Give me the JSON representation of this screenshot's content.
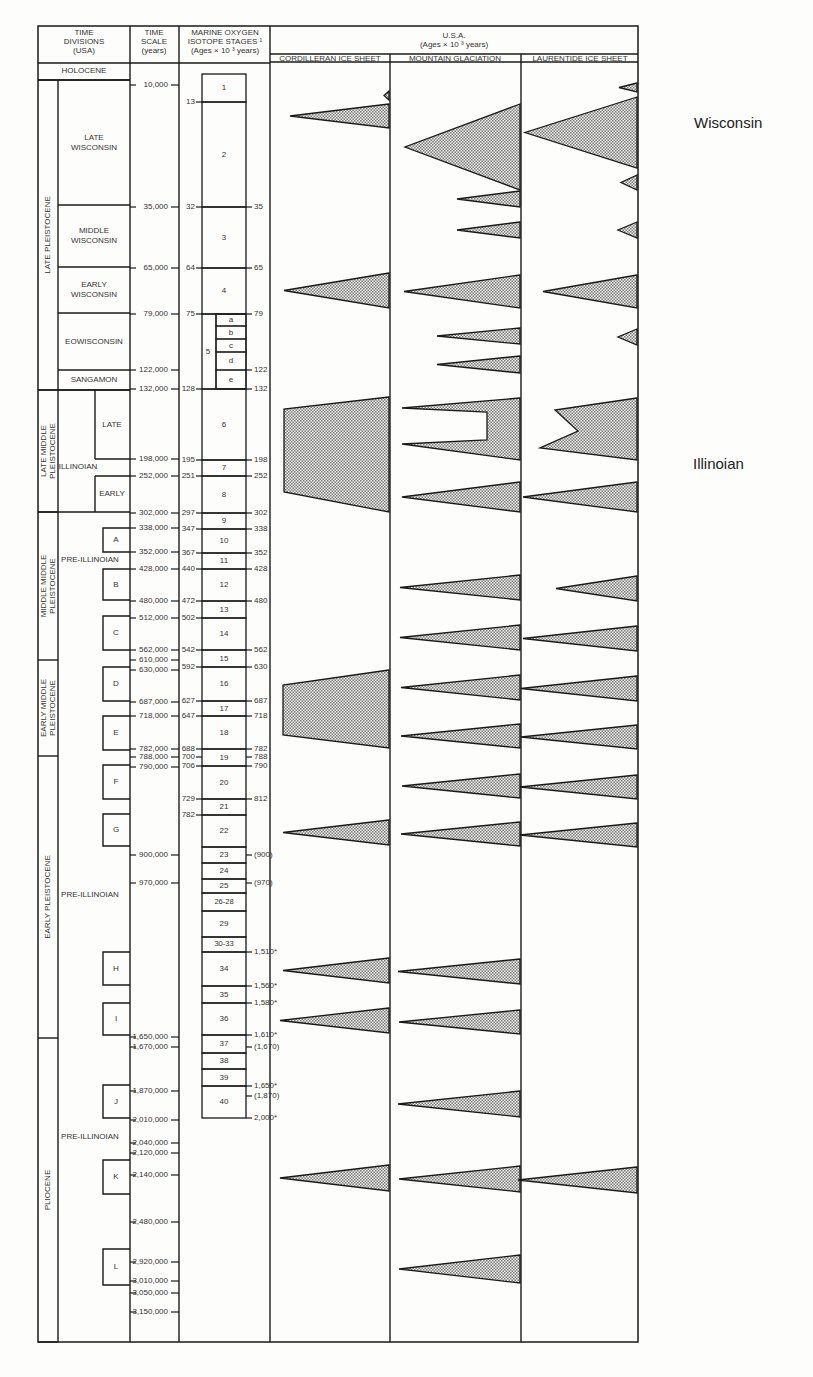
{
  "header": {
    "time_divisions": [
      "TIME",
      "DIVISIONS",
      "(USA)"
    ],
    "time_scale": [
      "TIME",
      "SCALE",
      "(years)"
    ],
    "isotope": [
      "MARINE OXYGEN",
      "ISOTOPE STAGES ¹",
      "(Ages × 10 ³  years)"
    ],
    "usa": [
      "U.S.A.",
      "(Ages × 10 ³ years)"
    ],
    "cols": [
      "CORDILLERAN ICE SHEET",
      "MOUNTAIN GLACIATION",
      "LAURENTIDE ICE SHEET"
    ]
  },
  "side_labels": {
    "wisconsin": "Wisconsin",
    "illinoian": "Illinoian"
  },
  "chart_data": {
    "type": "table",
    "epochs": [
      {
        "label": "HOLOCENE",
        "y0": 62,
        "y1": 80
      },
      {
        "label": "LATE PLEISTOCENE",
        "y0": 80,
        "y1": 390
      },
      {
        "label": "LATE MIDDLE PLEISTOCENE",
        "y0": 390,
        "y1": 512
      },
      {
        "label": "MIDDLE MIDDLE PLEISTOCENE",
        "y0": 512,
        "y1": 660
      },
      {
        "label": "EARLY MIDDLE PLEISTOCENE",
        "y0": 660,
        "y1": 756
      },
      {
        "label": "EARLY PLEISTOCENE",
        "y0": 756,
        "y1": 1038
      },
      {
        "label": "PLIOCENE",
        "y0": 1038,
        "y1": 1342
      }
    ],
    "stages_usa": [
      {
        "label": "LATE WISCONSIN",
        "y0": 80,
        "y1": 205
      },
      {
        "label": "MIDDLE WISCONSIN",
        "y0": 205,
        "y1": 267
      },
      {
        "label": "EARLY WISCONSIN",
        "y0": 267,
        "y1": 313
      },
      {
        "label": "EOWISCONSIN",
        "y0": 313,
        "y1": 370
      },
      {
        "label": "SANGAMON",
        "y0": 370,
        "y1": 390
      },
      {
        "label": "ILLINOIAN",
        "y": 467
      },
      {
        "label": "PRE-ILLINOIAN",
        "y": 560
      },
      {
        "label": "PRE-ILLINOIAN",
        "y": 895
      },
      {
        "label": "PRE-ILLINOIAN",
        "y": 1137
      }
    ],
    "illinoian_sub": [
      {
        "label": "LATE",
        "y0": 390,
        "y1": 459
      },
      {
        "label": "EARLY",
        "y0": 476,
        "y1": 512
      }
    ],
    "glaciation_boxes": [
      {
        "label": "A",
        "y0": 528,
        "y1": 552
      },
      {
        "label": "B",
        "y0": 569,
        "y1": 600
      },
      {
        "label": "C",
        "y0": 616,
        "y1": 650
      },
      {
        "label": "D",
        "y0": 667,
        "y1": 701
      },
      {
        "label": "E",
        "y0": 716,
        "y1": 750
      },
      {
        "label": "F",
        "y0": 765,
        "y1": 799
      },
      {
        "label": "G",
        "y0": 814,
        "y1": 846
      },
      {
        "label": "H",
        "y0": 952,
        "y1": 985
      },
      {
        "label": "I",
        "y0": 1003,
        "y1": 1035
      },
      {
        "label": "J",
        "y0": 1085,
        "y1": 1118
      },
      {
        "label": "K",
        "y0": 1160,
        "y1": 1194
      },
      {
        "label": "L",
        "y0": 1249,
        "y1": 1285
      }
    ],
    "time_scale": [
      {
        "label": "10,000",
        "y": 85
      },
      {
        "label": "35,000",
        "y": 207
      },
      {
        "label": "65,000",
        "y": 268
      },
      {
        "label": "79,000",
        "y": 314
      },
      {
        "label": "122,000",
        "y": 370
      },
      {
        "label": "132,000",
        "y": 389
      },
      {
        "label": "198,000",
        "y": 459
      },
      {
        "label": "252,000",
        "y": 476
      },
      {
        "label": "302,000",
        "y": 513
      },
      {
        "label": "338,000",
        "y": 528
      },
      {
        "label": "352,000",
        "y": 552
      },
      {
        "label": "428,000",
        "y": 569
      },
      {
        "label": "480,000",
        "y": 601
      },
      {
        "label": "512,000",
        "y": 618
      },
      {
        "label": "562,000",
        "y": 650
      },
      {
        "label": "610,000",
        "y": 660
      },
      {
        "label": "630,000",
        "y": 670
      },
      {
        "label": "687,000",
        "y": 702
      },
      {
        "label": "718,000",
        "y": 716
      },
      {
        "label": "782,000",
        "y": 749
      },
      {
        "label": "788,000",
        "y": 757
      },
      {
        "label": "790,000",
        "y": 767
      },
      {
        "label": "900,000",
        "y": 855
      },
      {
        "label": "970,000",
        "y": 883
      },
      {
        "label": "1,650,000",
        "y": 1037
      },
      {
        "label": "1,670,000",
        "y": 1047
      },
      {
        "label": "1,870,000",
        "y": 1091
      },
      {
        "label": "2,010,000",
        "y": 1120
      },
      {
        "label": "2,040,000",
        "y": 1143
      },
      {
        "label": "2,120,000",
        "y": 1153
      },
      {
        "label": "2,140,000",
        "y": 1175
      },
      {
        "label": "2,480,000",
        "y": 1222
      },
      {
        "label": "2,920,000",
        "y": 1262
      },
      {
        "label": "3,010,000",
        "y": 1281
      },
      {
        "label": "3,050,000",
        "y": 1293
      },
      {
        "label": "3,150,000",
        "y": 1312
      }
    ],
    "isotope_stages": [
      {
        "label": "1",
        "y0": 74,
        "y1": 102
      },
      {
        "label": "2",
        "y0": 102,
        "y1": 207
      },
      {
        "label": "3",
        "y0": 207,
        "y1": 268
      },
      {
        "label": "4",
        "y0": 268,
        "y1": 314
      },
      {
        "label": "5",
        "y0": 314,
        "y1": 389
      },
      {
        "label": "6",
        "y0": 389,
        "y1": 460
      },
      {
        "label": "7",
        "y0": 460,
        "y1": 476
      },
      {
        "label": "8",
        "y0": 476,
        "y1": 513
      },
      {
        "label": "9",
        "y0": 513,
        "y1": 529
      },
      {
        "label": "10",
        "y0": 529,
        "y1": 553
      },
      {
        "label": "11",
        "y0": 553,
        "y1": 569
      },
      {
        "label": "12",
        "y0": 569,
        "y1": 601
      },
      {
        "label": "13",
        "y0": 601,
        "y1": 618
      },
      {
        "label": "14",
        "y0": 618,
        "y1": 650
      },
      {
        "label": "15",
        "y0": 650,
        "y1": 667
      },
      {
        "label": "16",
        "y0": 667,
        "y1": 701
      },
      {
        "label": "17",
        "y0": 701,
        "y1": 716
      },
      {
        "label": "18",
        "y0": 716,
        "y1": 749
      },
      {
        "label": "19",
        "y0": 749,
        "y1": 766
      },
      {
        "label": "20",
        "y0": 766,
        "y1": 799
      },
      {
        "label": "21",
        "y0": 799,
        "y1": 815
      },
      {
        "label": "22",
        "y0": 815,
        "y1": 847
      },
      {
        "label": "23",
        "y0": 847,
        "y1": 863
      },
      {
        "label": "24",
        "y0": 863,
        "y1": 879
      },
      {
        "label": "25",
        "y0": 879,
        "y1": 893
      },
      {
        "label": "26-28",
        "y0": 893,
        "y1": 911
      },
      {
        "label": "29",
        "y0": 911,
        "y1": 937
      },
      {
        "label": "30-33",
        "y0": 937,
        "y1": 952
      },
      {
        "label": "34",
        "y0": 952,
        "y1": 986
      },
      {
        "label": "35",
        "y0": 986,
        "y1": 1003
      },
      {
        "label": "36",
        "y0": 1003,
        "y1": 1035
      },
      {
        "label": "37",
        "y0": 1035,
        "y1": 1053
      },
      {
        "label": "38",
        "y0": 1053,
        "y1": 1069
      },
      {
        "label": "39",
        "y0": 1069,
        "y1": 1086
      },
      {
        "label": "40",
        "y0": 1086,
        "y1": 1118
      }
    ],
    "stage5_sub": [
      {
        "label": "a",
        "y0": 314,
        "y1": 326
      },
      {
        "label": "b",
        "y0": 326,
        "y1": 339
      },
      {
        "label": "c",
        "y0": 339,
        "y1": 352
      },
      {
        "label": "d",
        "y0": 352,
        "y1": 370
      },
      {
        "label": "e",
        "y0": 370,
        "y1": 389
      }
    ],
    "isotope_left_ages": [
      {
        "label": "13",
        "y": 102
      },
      {
        "label": "32",
        "y": 207
      },
      {
        "label": "64",
        "y": 268
      },
      {
        "label": "75",
        "y": 314
      },
      {
        "label": "128",
        "y": 389
      },
      {
        "label": "195",
        "y": 460
      },
      {
        "label": "251",
        "y": 476
      },
      {
        "label": "297",
        "y": 513
      },
      {
        "label": "347",
        "y": 529
      },
      {
        "label": "367",
        "y": 553
      },
      {
        "label": "440",
        "y": 569
      },
      {
        "label": "472",
        "y": 601
      },
      {
        "label": "502",
        "y": 618
      },
      {
        "label": "542",
        "y": 650
      },
      {
        "label": "592",
        "y": 667
      },
      {
        "label": "627",
        "y": 701
      },
      {
        "label": "647",
        "y": 716
      },
      {
        "label": "688",
        "y": 749
      },
      {
        "label": "700",
        "y": 757
      },
      {
        "label": "706",
        "y": 766
      },
      {
        "label": "729",
        "y": 799
      },
      {
        "label": "782",
        "y": 815
      }
    ],
    "isotope_right_ages": [
      {
        "label": "35",
        "y": 207
      },
      {
        "label": "65",
        "y": 268
      },
      {
        "label": "79",
        "y": 314
      },
      {
        "label": "122",
        "y": 370
      },
      {
        "label": "132",
        "y": 389
      },
      {
        "label": "198",
        "y": 460
      },
      {
        "label": "252",
        "y": 476
      },
      {
        "label": "302",
        "y": 513
      },
      {
        "label": "338",
        "y": 529
      },
      {
        "label": "352",
        "y": 553
      },
      {
        "label": "428",
        "y": 569
      },
      {
        "label": "480",
        "y": 601
      },
      {
        "label": "562",
        "y": 650
      },
      {
        "label": "630",
        "y": 667
      },
      {
        "label": "687",
        "y": 701
      },
      {
        "label": "718",
        "y": 716
      },
      {
        "label": "782",
        "y": 749
      },
      {
        "label": "788",
        "y": 757
      },
      {
        "label": "790",
        "y": 766
      },
      {
        "label": "812",
        "y": 799
      },
      {
        "label": "(900)",
        "y": 855
      },
      {
        "label": "(970)",
        "y": 883
      },
      {
        "label": "1,510*",
        "y": 952
      },
      {
        "label": "1,560*",
        "y": 986
      },
      {
        "label": "1,580*",
        "y": 1003
      },
      {
        "label": "1,610*",
        "y": 1035
      },
      {
        "label": "(1,670)",
        "y": 1047
      },
      {
        "label": "1,650*",
        "y": 1086
      },
      {
        "label": "(1,870)",
        "y": 1096
      },
      {
        "label": "2,000*",
        "y": 1118
      }
    ],
    "glaciations": {
      "cordilleran": [
        {
          "shape": "tri",
          "top": 91,
          "bottom": 100,
          "tip_x": 384
        },
        {
          "shape": "tri",
          "top": 104,
          "bottom": 128,
          "tip_x": 290
        },
        {
          "shape": "tri",
          "top": 273,
          "bottom": 308,
          "tip_x": 284
        },
        {
          "shape": "trap",
          "top": 397,
          "bottom": 512,
          "left_top": 409,
          "left_bottom": 492,
          "tip_x": 284
        },
        {
          "shape": "trap",
          "top": 670,
          "bottom": 748,
          "left_top": 685,
          "left_bottom": 735,
          "tip_x": 283
        },
        {
          "shape": "tri",
          "top": 820,
          "bottom": 845,
          "tip_x": 283
        },
        {
          "shape": "tri",
          "top": 958,
          "bottom": 983,
          "tip_x": 283
        },
        {
          "shape": "tri",
          "top": 1008,
          "bottom": 1033,
          "tip_x": 280
        },
        {
          "shape": "tri",
          "top": 1165,
          "bottom": 1191,
          "tip_x": 280
        }
      ],
      "mountain": [
        {
          "shape": "tri",
          "top": 104,
          "bottom": 190,
          "tip_x": 405
        },
        {
          "shape": "tri",
          "top": 191,
          "bottom": 207,
          "tip_x": 457
        },
        {
          "shape": "tri",
          "top": 222,
          "bottom": 238,
          "tip_x": 457
        },
        {
          "shape": "tri",
          "top": 275,
          "bottom": 308,
          "tip_x": 404
        },
        {
          "shape": "tri",
          "top": 328,
          "bottom": 344,
          "tip_x": 437
        },
        {
          "shape": "tri",
          "top": 356,
          "bottom": 373,
          "tip_x": 437
        },
        {
          "shape": "fork",
          "top": 398,
          "bottom": 460,
          "tip_x": 402
        },
        {
          "shape": "tri",
          "top": 482,
          "bottom": 512,
          "tip_x": 402
        },
        {
          "shape": "tri",
          "top": 575,
          "bottom": 600,
          "tip_x": 400
        },
        {
          "shape": "tri",
          "top": 625,
          "bottom": 650,
          "tip_x": 400
        },
        {
          "shape": "tri",
          "top": 675,
          "bottom": 700,
          "tip_x": 401
        },
        {
          "shape": "tri",
          "top": 724,
          "bottom": 748,
          "tip_x": 401
        },
        {
          "shape": "tri",
          "top": 774,
          "bottom": 798,
          "tip_x": 402
        },
        {
          "shape": "tri",
          "top": 822,
          "bottom": 846,
          "tip_x": 401
        },
        {
          "shape": "tri",
          "top": 959,
          "bottom": 984,
          "tip_x": 398
        },
        {
          "shape": "tri",
          "top": 1010,
          "bottom": 1034,
          "tip_x": 399
        },
        {
          "shape": "tri",
          "top": 1091,
          "bottom": 1117,
          "tip_x": 398
        },
        {
          "shape": "tri",
          "top": 1166,
          "bottom": 1192,
          "tip_x": 399
        },
        {
          "shape": "tri",
          "top": 1255,
          "bottom": 1283,
          "tip_x": 399
        }
      ],
      "laurentide": [
        {
          "shape": "tri",
          "top": 83,
          "bottom": 92,
          "tip_x": 619
        },
        {
          "shape": "tri",
          "top": 97,
          "bottom": 168,
          "tip_x": 525
        },
        {
          "shape": "tri",
          "top": 175,
          "bottom": 190,
          "tip_x": 621
        },
        {
          "shape": "tri",
          "top": 222,
          "bottom": 238,
          "tip_x": 618
        },
        {
          "shape": "tri",
          "top": 275,
          "bottom": 308,
          "tip_x": 543
        },
        {
          "shape": "tri",
          "top": 329,
          "bottom": 345,
          "tip_x": 618
        },
        {
          "shape": "zig",
          "top": 398,
          "bottom": 460,
          "tip_x": 540
        },
        {
          "shape": "tri",
          "top": 482,
          "bottom": 512,
          "tip_x": 523
        },
        {
          "shape": "tri",
          "top": 576,
          "bottom": 601,
          "tip_x": 556
        },
        {
          "shape": "tri",
          "top": 626,
          "bottom": 651,
          "tip_x": 523
        },
        {
          "shape": "tri",
          "top": 676,
          "bottom": 701,
          "tip_x": 521
        },
        {
          "shape": "tri",
          "top": 725,
          "bottom": 749,
          "tip_x": 521
        },
        {
          "shape": "tri",
          "top": 775,
          "bottom": 799,
          "tip_x": 520
        },
        {
          "shape": "tri",
          "top": 823,
          "bottom": 847,
          "tip_x": 520
        },
        {
          "shape": "tri",
          "top": 1167,
          "bottom": 1193,
          "tip_x": 518
        }
      ]
    }
  }
}
